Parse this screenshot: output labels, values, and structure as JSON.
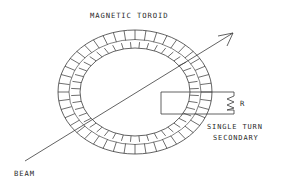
{
  "diagram": {
    "title": "MAGNETIC TOROID",
    "labels": {
      "beam": "BEAM",
      "resistor": "R",
      "secondary_line1": "SINGLE TURN",
      "secondary_line2": "SECONDARY"
    },
    "colors": {
      "background": "#ffffff",
      "stroke": "#3a3a3a",
      "text": "#2b2b2b"
    },
    "geometry": {
      "toroid_center_x": 135,
      "toroid_center_y": 92,
      "outer_rx": 77,
      "outer_ry": 62,
      "band_rx": 66,
      "band_ry": 52,
      "inner_rx": 55,
      "inner_ry": 44,
      "winding_turns": 44,
      "beam_start_x": 25,
      "beam_start_y": 161,
      "beam_end_x": 233,
      "beam_end_y": 33,
      "secondary_rect_x": 161,
      "secondary_rect_y": 92,
      "secondary_rect_w": 51,
      "secondary_rect_h": 22,
      "resistor_x": 226,
      "resistor_top_y": 93,
      "resistor_bottom_y": 114
    }
  }
}
